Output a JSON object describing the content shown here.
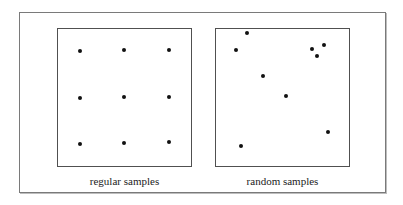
{
  "figure": {
    "panels": [
      {
        "id": "regular",
        "caption": "regular samples",
        "points": [
          {
            "x": 80,
            "y": 51
          },
          {
            "x": 124,
            "y": 50
          },
          {
            "x": 169,
            "y": 50
          },
          {
            "x": 80,
            "y": 98
          },
          {
            "x": 124,
            "y": 97
          },
          {
            "x": 169,
            "y": 97
          },
          {
            "x": 80,
            "y": 144
          },
          {
            "x": 124,
            "y": 143
          },
          {
            "x": 169,
            "y": 142
          }
        ]
      },
      {
        "id": "random",
        "caption": "random samples",
        "points": [
          {
            "x": 247,
            "y": 33
          },
          {
            "x": 236,
            "y": 50
          },
          {
            "x": 312,
            "y": 49
          },
          {
            "x": 324,
            "y": 45
          },
          {
            "x": 317,
            "y": 56
          },
          {
            "x": 263,
            "y": 76
          },
          {
            "x": 286,
            "y": 96
          },
          {
            "x": 328,
            "y": 132
          },
          {
            "x": 241,
            "y": 146
          }
        ]
      }
    ],
    "colors": {
      "dot": "#111111",
      "frame": "#7a7a7a",
      "panel_border": "#505050"
    }
  }
}
